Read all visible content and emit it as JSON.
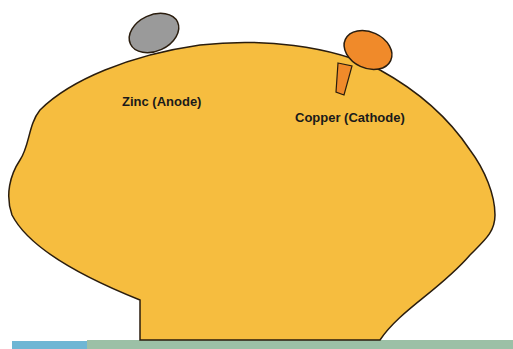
{
  "diagram": {
    "labels": {
      "anode": "Zinc (Anode)",
      "cathode": "Copper (Cathode)"
    },
    "colors": {
      "lemon": "#f6bd3f",
      "outline": "#2a1d0e",
      "zinc": "#9a9a9a",
      "copper": "#f08a2a",
      "bar_blue": "#6eb6d4",
      "bar_green": "#9cc0a6"
    }
  }
}
